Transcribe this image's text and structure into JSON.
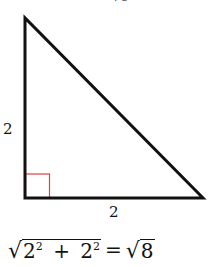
{
  "diagram": {
    "type": "right-triangle",
    "stroke_color": "#111111",
    "right_angle_marker_color": "#e04040",
    "vertices": {
      "apex": [
        25,
        18
      ],
      "right_angle": [
        25,
        198
      ],
      "base_right": [
        203,
        198
      ]
    },
    "labels": {
      "left_side": "2",
      "bottom_side": "2",
      "top_clipped": "√8"
    }
  },
  "formula": {
    "radicand_a_base": "2",
    "radicand_a_exp": "2",
    "plus": "+",
    "radicand_b_base": "2",
    "radicand_b_exp": "2",
    "equals": "=",
    "result_radicand": "8",
    "radical": "√"
  }
}
